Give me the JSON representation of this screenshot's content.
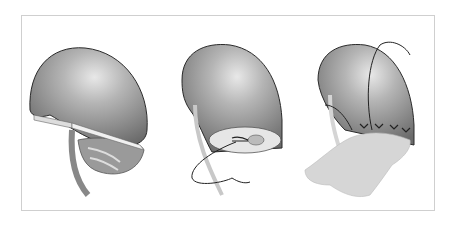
{
  "figure": {
    "panels": [
      {
        "name": "incision",
        "icon": "scalpel-icon"
      },
      {
        "name": "suture-collecting-system",
        "icon": "suture-icon"
      },
      {
        "name": "closure-with-bolster",
        "icon": "bolster-icon"
      }
    ],
    "colors": {
      "organ_dark": "#6f6f6f",
      "organ_mid": "#9a9a9a",
      "organ_light": "#e2e2e2",
      "outline": "#2a2a2a",
      "frame": "#cfcfcf",
      "tissue": "#cfcfcf"
    }
  }
}
